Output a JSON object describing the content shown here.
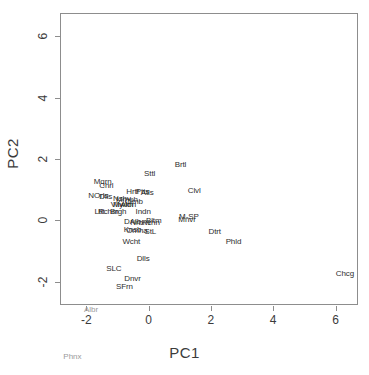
{
  "chart_data": {
    "type": "scatter",
    "title": "",
    "xlabel": "PC1",
    "ylabel": "PC2",
    "xlim": [
      -2.85,
      6.72
    ],
    "ylim": [
      -2.75,
      6.75
    ],
    "xticks": [
      -2,
      0,
      2,
      4,
      6
    ],
    "yticks": [
      -2,
      0,
      2,
      4,
      6
    ],
    "xticklabels": [
      "-2",
      "0",
      "2",
      "4",
      "6"
    ],
    "yticklabels": [
      "-2",
      "0",
      "2",
      "4",
      "6"
    ],
    "grid": false,
    "legend": "none",
    "marker": "text-label",
    "points": [
      {
        "label": "Mqrn",
        "x": -1.48,
        "y": 1.29
      },
      {
        "label": "Chrl",
        "x": -1.36,
        "y": 1.14
      },
      {
        "label": "NOrls",
        "x": -1.62,
        "y": 0.82
      },
      {
        "label": "Dlls",
        "x": -1.38,
        "y": 0.8
      },
      {
        "label": "Hrtf",
        "x": -0.52,
        "y": 0.95
      },
      {
        "label": "Ptts",
        "x": -0.2,
        "y": 0.95
      },
      {
        "label": "Atls",
        "x": -0.05,
        "y": 0.94
      },
      {
        "label": "Sttl",
        "x": 0.03,
        "y": 1.56
      },
      {
        "label": "Brtl",
        "x": 1.02,
        "y": 1.84
      },
      {
        "label": "Clvl",
        "x": 1.46,
        "y": 1.0
      },
      {
        "label": "Nshv",
        "x": -0.86,
        "y": 0.73
      },
      {
        "label": "Mmph",
        "x": -0.7,
        "y": 0.7
      },
      {
        "label": "Clmb",
        "x": -0.48,
        "y": 0.62
      },
      {
        "label": "Vlly",
        "x": -1.02,
        "y": 0.54
      },
      {
        "label": "Mwkn",
        "x": -0.82,
        "y": 0.52
      },
      {
        "label": "Albn",
        "x": -0.66,
        "y": 0.52
      },
      {
        "label": "Ltlt",
        "x": -1.58,
        "y": 0.32
      },
      {
        "label": "Rchm",
        "x": -1.3,
        "y": 0.3
      },
      {
        "label": "Brgh",
        "x": -0.98,
        "y": 0.3
      },
      {
        "label": "Indn",
        "x": -0.18,
        "y": 0.3
      },
      {
        "label": "M-SP",
        "x": 1.29,
        "y": 0.14
      },
      {
        "label": "Mnvr",
        "x": 1.23,
        "y": 0.05
      },
      {
        "label": "Dtrt",
        "x": 2.12,
        "y": -0.33
      },
      {
        "label": "Phld",
        "x": 2.72,
        "y": -0.67
      },
      {
        "label": "DAlb",
        "x": -0.52,
        "y": -0.02
      },
      {
        "label": "Nrbrn",
        "x": -0.28,
        "y": -0.06
      },
      {
        "label": "Rchn",
        "x": 0.06,
        "y": -0.06
      },
      {
        "label": "Bltm",
        "x": 0.16,
        "y": 0.01
      },
      {
        "label": "Knsb",
        "x": -0.52,
        "y": -0.28
      },
      {
        "label": "Omha",
        "x": -0.38,
        "y": -0.3
      },
      {
        "label": "StL",
        "x": 0.05,
        "y": -0.34
      },
      {
        "label": "Wcht",
        "x": -0.56,
        "y": -0.66
      },
      {
        "label": "Dlls2",
        "x": -0.18,
        "y": -1.22
      },
      {
        "label": "SLC",
        "x": -1.12,
        "y": -1.56
      },
      {
        "label": "Dnvr",
        "x": -0.52,
        "y": -1.88
      },
      {
        "label": "SFrn",
        "x": -0.78,
        "y": -2.12
      },
      {
        "label": "Chcg",
        "x": 6.3,
        "y": -1.7
      },
      {
        "label": "Albr",
        "x": -1.85,
        "y": -2.88
      },
      {
        "label": "Phnx",
        "x": -2.45,
        "y": -4.4
      }
    ]
  }
}
